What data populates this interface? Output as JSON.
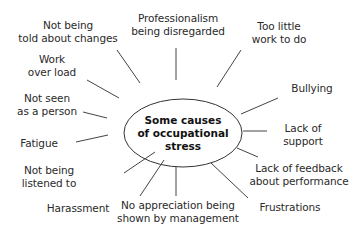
{
  "diagram": {
    "center": "Some causes\nof occupational\nstress",
    "causes": [
      {
        "id": "told-about-changes",
        "label": "Not being\ntold about changes"
      },
      {
        "id": "professionalism",
        "label": "Professionalism\nbeing disregarded"
      },
      {
        "id": "too-little-work",
        "label": "Too little\nwork to do"
      },
      {
        "id": "bullying",
        "label": "Bullying"
      },
      {
        "id": "lack-of-support",
        "label": "Lack of\nsupport"
      },
      {
        "id": "lack-of-feedback",
        "label": "Lack of feedback\nabout performance"
      },
      {
        "id": "frustrations",
        "label": "Frustrations"
      },
      {
        "id": "no-appreciation",
        "label": "No appreciation being\nshown by management"
      },
      {
        "id": "harassment",
        "label": "Harassment"
      },
      {
        "id": "not-listened-to",
        "label": "Not being\nlistened to"
      },
      {
        "id": "fatigue",
        "label": "Fatigue"
      },
      {
        "id": "not-seen-as-person",
        "label": "Not seen\nas a person"
      },
      {
        "id": "work-overload",
        "label": "Work\nover load"
      }
    ]
  }
}
